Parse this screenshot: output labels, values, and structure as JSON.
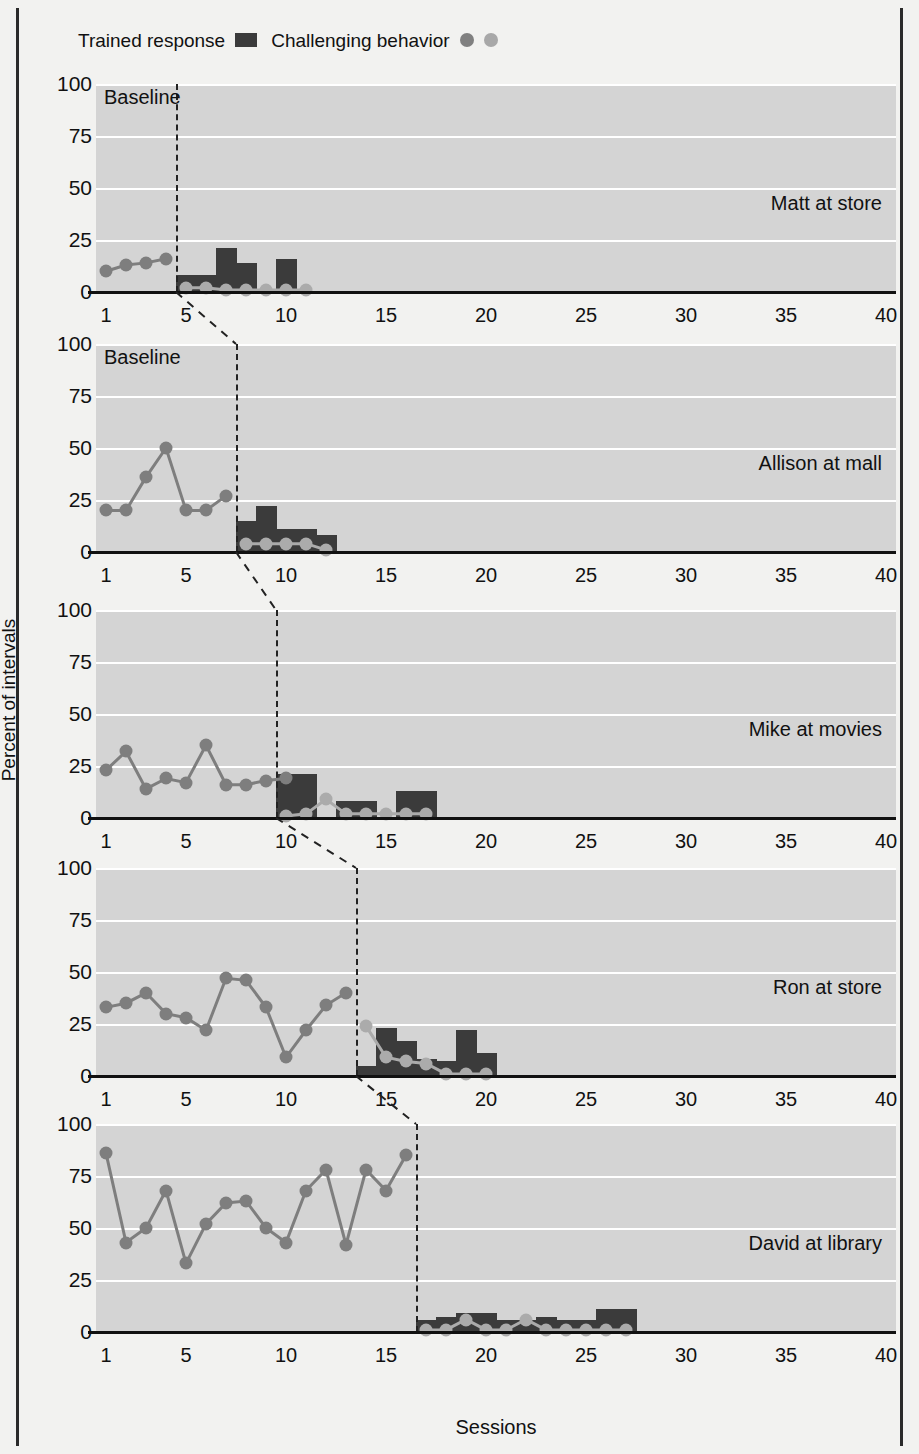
{
  "figure": {
    "y_axis_label": "Percent of intervals",
    "x_axis_label": "Sessions",
    "y_ticks": [
      "0",
      "25",
      "50",
      "75",
      "100"
    ],
    "x_ticks": [
      "1",
      "5",
      "10",
      "15",
      "20",
      "25",
      "30",
      "35",
      "40"
    ],
    "phase_label": "Baseline",
    "colors": {
      "bar": "#3b3b3b",
      "marker_dark": "#7e7e7e",
      "marker_light": "#ababab",
      "plot_bg": "#d4d4d4",
      "gridline": "#ffffff",
      "axis": "#111111"
    }
  },
  "legend": {
    "items": [
      {
        "label": "Trained response",
        "glyph": "bar-swatch"
      },
      {
        "label": "Challenging behavior",
        "glyph": "dot-pair"
      }
    ]
  },
  "chart_data": {
    "type": "line",
    "title": "",
    "xlabel": "Sessions",
    "ylabel": "Percent of intervals",
    "xlim": [
      0.5,
      40.5
    ],
    "ylim": [
      0,
      100
    ],
    "yticks": [
      0,
      25,
      50,
      75,
      100
    ],
    "xticks": [
      1,
      5,
      10,
      15,
      20,
      25,
      30,
      35,
      40
    ],
    "grid": true,
    "legend_position": "top-left",
    "design": "multiple-baseline across participants",
    "panels": [
      {
        "name": "Matt at store",
        "phase_label": "Baseline",
        "phase_change_session": 4.5,
        "baseline": {
          "series_name": "Challenging behavior",
          "x": [
            1,
            2,
            3,
            4
          ],
          "y": [
            10,
            13,
            14,
            16
          ]
        },
        "intervention": {
          "trained_response_bars": {
            "series_name": "Trained response",
            "x": [
              5,
              6,
              7,
              8,
              9,
              10
            ],
            "y": [
              8,
              8,
              21,
              14,
              0,
              16
            ]
          },
          "challenging_behavior": {
            "series_name": "Challenging behavior",
            "x": [
              5,
              6,
              7,
              8,
              9,
              10,
              11
            ],
            "y": [
              2,
              2,
              1,
              1,
              1,
              1,
              1
            ]
          }
        }
      },
      {
        "name": "Allison at mall",
        "phase_label": "Baseline",
        "phase_change_session": 7.5,
        "baseline": {
          "series_name": "Challenging behavior",
          "x": [
            1,
            2,
            3,
            4,
            5,
            6,
            7
          ],
          "y": [
            20,
            20,
            36,
            50,
            20,
            20,
            27
          ]
        },
        "intervention": {
          "trained_response_bars": {
            "series_name": "Trained response",
            "x": [
              8,
              9,
              10,
              11,
              12
            ],
            "y": [
              15,
              22,
              11,
              11,
              8
            ]
          },
          "challenging_behavior": {
            "series_name": "Challenging behavior",
            "x": [
              8,
              9,
              10,
              11,
              12
            ],
            "y": [
              4,
              4,
              4,
              4,
              1
            ]
          }
        }
      },
      {
        "name": "Mike at movies",
        "phase_label": "",
        "phase_change_session": 9.5,
        "baseline": {
          "series_name": "Challenging behavior",
          "x": [
            1,
            2,
            3,
            4,
            5,
            6,
            7,
            8,
            9,
            10
          ],
          "y": [
            23,
            32,
            14,
            19,
            17,
            35,
            16,
            16,
            18,
            19
          ]
        },
        "intervention": {
          "trained_response_bars": {
            "series_name": "Trained response",
            "x": [
              10,
              11,
              12,
              13,
              14,
              15,
              16,
              17
            ],
            "y": [
              21,
              21,
              0,
              8,
              8,
              0,
              13,
              13
            ]
          },
          "challenging_behavior": {
            "series_name": "Challenging behavior",
            "x": [
              10,
              11,
              12,
              13,
              14,
              15,
              16,
              17
            ],
            "y": [
              1,
              2,
              9,
              2,
              2,
              2,
              2,
              2
            ]
          }
        }
      },
      {
        "name": "Ron at store",
        "phase_label": "",
        "phase_change_session": 13.5,
        "baseline": {
          "series_name": "Challenging behavior",
          "x": [
            1,
            2,
            3,
            4,
            5,
            6,
            7,
            8,
            9,
            10,
            11,
            12,
            13
          ],
          "y": [
            33,
            35,
            40,
            30,
            28,
            22,
            47,
            46,
            33,
            9,
            22,
            34,
            40
          ]
        },
        "intervention": {
          "trained_response_bars": {
            "series_name": "Trained response",
            "x": [
              14,
              15,
              16,
              17,
              18,
              19,
              20
            ],
            "y": [
              5,
              23,
              17,
              8,
              7,
              22,
              11
            ]
          },
          "challenging_behavior": {
            "series_name": "Challenging behavior",
            "x": [
              14,
              15,
              16,
              17,
              18,
              19,
              20
            ],
            "y": [
              24,
              9,
              7,
              6,
              1,
              1,
              1
            ]
          }
        }
      },
      {
        "name": "David at library",
        "phase_label": "",
        "phase_change_session": 16.5,
        "baseline": {
          "series_name": "Challenging behavior",
          "x": [
            1,
            2,
            3,
            4,
            5,
            6,
            7,
            8,
            9,
            10,
            11,
            12,
            13,
            14,
            15,
            16
          ],
          "y": [
            86,
            43,
            50,
            68,
            33,
            52,
            62,
            63,
            50,
            43,
            68,
            78,
            42,
            78,
            68,
            85
          ]
        },
        "intervention": {
          "trained_response_bars": {
            "series_name": "Trained response",
            "x": [
              17,
              18,
              19,
              20,
              21,
              22,
              23,
              24,
              25,
              26,
              27
            ],
            "y": [
              6,
              7,
              9,
              9,
              6,
              6,
              7,
              6,
              6,
              11,
              11
            ]
          },
          "challenging_behavior": {
            "series_name": "Challenging behavior",
            "x": [
              17,
              18,
              19,
              20,
              21,
              22,
              23,
              24,
              25,
              26,
              27
            ],
            "y": [
              1,
              1,
              6,
              1,
              1,
              6,
              1,
              1,
              1,
              1,
              1
            ]
          }
        }
      }
    ]
  }
}
